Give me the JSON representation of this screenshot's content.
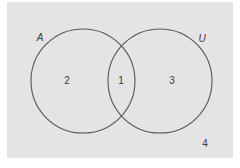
{
  "diagram": {
    "type": "venn",
    "background_color": "#e4e4e4",
    "stroke_color": "#555555",
    "sets": [
      {
        "label": "A",
        "cx": 83,
        "cy": 81,
        "r": 52
      },
      {
        "label": "U",
        "cx": 160,
        "cy": 81,
        "r": 52
      }
    ],
    "regions": [
      {
        "id": "A_only",
        "label": "2"
      },
      {
        "id": "A_and_U",
        "label": "1"
      },
      {
        "id": "U_only",
        "label": "3"
      },
      {
        "id": "outside",
        "label": "4"
      }
    ]
  }
}
